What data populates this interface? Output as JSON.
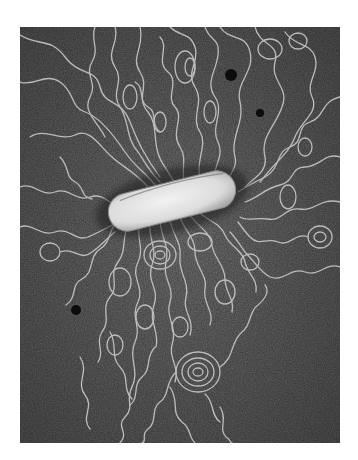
{
  "image": {
    "subject": "electron micrograph of a lysed bacterium with DNA strands spreading outward",
    "background_color": "#4a4a4a",
    "strand_color": "#c8c8c8",
    "cell_color": "#e4e4e4",
    "page_background": "#ffffff",
    "frame": {
      "x": 20,
      "y": 27,
      "width": 320,
      "height": 416
    },
    "cell": {
      "cx": 152,
      "cy": 174,
      "length": 130,
      "thickness": 38,
      "angle": -14
    },
    "dark_spots": [
      {
        "x": 211,
        "y": 48,
        "r": 6
      },
      {
        "x": 240,
        "y": 86,
        "r": 4
      },
      {
        "x": 56,
        "y": 283,
        "r": 5
      }
    ]
  }
}
